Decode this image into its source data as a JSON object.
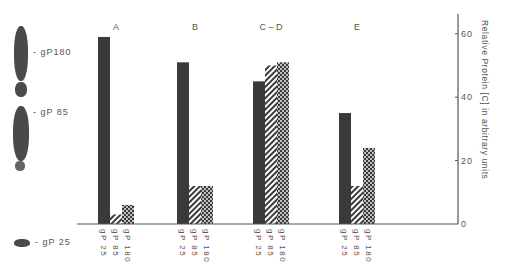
{
  "gel": {
    "labels": [
      {
        "text": "- gP180",
        "y": 53
      },
      {
        "text": "- gP 85",
        "y": 113
      },
      {
        "text": "- gP 25",
        "y": 243
      }
    ]
  },
  "chart_data": {
    "type": "bar",
    "title": "",
    "xlabel": "",
    "ylabel": "Relative Protein [C] in arbitrary units",
    "ylim": [
      0,
      65
    ],
    "yticks": [
      0,
      20,
      40,
      60
    ],
    "y_axis_position": "right",
    "grid": false,
    "categories": [
      "A",
      "B",
      "C – D",
      "E"
    ],
    "series": [
      {
        "name": "gP 25",
        "pattern": "solid-dark",
        "values": [
          59,
          51,
          45,
          35
        ]
      },
      {
        "name": "gP 85",
        "pattern": "diagonal-hatch",
        "values": [
          3,
          12,
          50,
          12
        ]
      },
      {
        "name": "gP 180",
        "pattern": "checker",
        "values": [
          6,
          12,
          51,
          24
        ]
      }
    ],
    "bar_labels": [
      "gP 25",
      "gP 85",
      "gP 180"
    ]
  }
}
